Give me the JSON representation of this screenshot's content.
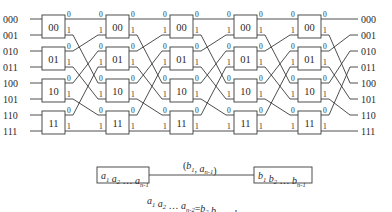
{
  "diagram": {
    "input_labels": [
      "000",
      "001",
      "010",
      "011",
      "100",
      "101",
      "110",
      "111"
    ],
    "output_labels": [
      "000",
      "001",
      "010",
      "011",
      "100",
      "101",
      "110",
      "111"
    ],
    "stages": 5,
    "switch_labels": [
      "00",
      "01",
      "10",
      "11"
    ],
    "port_labels": [
      "0",
      "1"
    ],
    "interstage_mapping": "line i of stage output -> line ((i >> 1) | ((i & 1) << 2)) of next stage input",
    "edge_example": {
      "left_node": {
        "parts": [
          [
            "a",
            "1"
          ],
          [
            "a",
            "2"
          ],
          [
            "…",
            ""
          ],
          [
            "a",
            "n-1"
          ]
        ]
      },
      "right_node": {
        "parts": [
          [
            "b",
            "1"
          ],
          [
            "b",
            "2"
          ],
          [
            "…",
            ""
          ],
          [
            "b",
            "n-1"
          ]
        ]
      },
      "edge_label": {
        "open": "(",
        "parts": [
          [
            "b",
            "1"
          ],
          [
            ", ",
            ""
          ],
          [
            "a",
            "n-1"
          ]
        ],
        "close": ")"
      },
      "equation": {
        "lhs": [
          [
            "a",
            "1"
          ],
          [
            "a",
            "2"
          ],
          [
            "…",
            ""
          ],
          [
            "a",
            "n-2"
          ]
        ],
        "eq": "=",
        "rhs": [
          [
            "b",
            "2"
          ],
          [
            "b",
            "3"
          ],
          [
            "…",
            ""
          ],
          [
            "b",
            "n-1"
          ]
        ]
      }
    },
    "colors": {
      "stroke": "#3a3a3a",
      "text": "#2a2a2a",
      "background": "#ffffff"
    }
  }
}
